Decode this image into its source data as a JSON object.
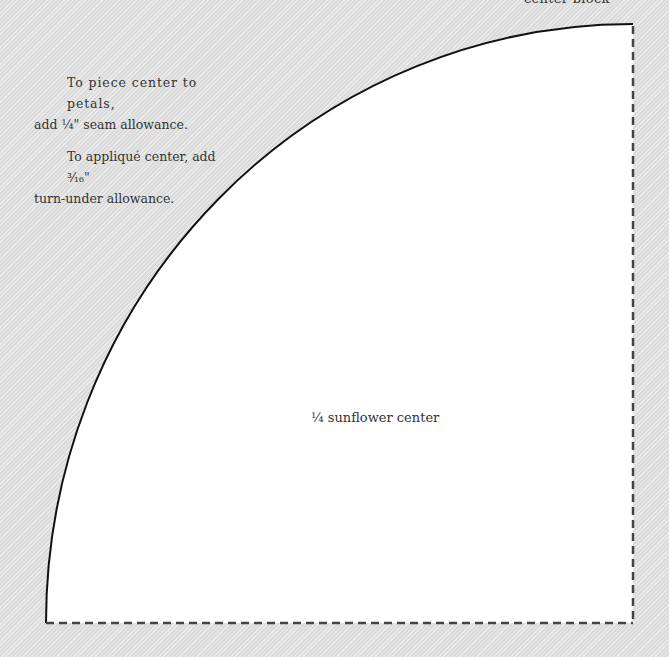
{
  "top_label": "center block",
  "notes": [
    {
      "line1": "To piece center to petals,",
      "line2": "add ¼\" seam allowance."
    },
    {
      "line1": "To appliqué center, add ³⁄₁₆\"",
      "line2": "turn-under allowance."
    }
  ],
  "piece_label": "¼ sunflower center",
  "colors": {
    "background": "#e2e2e2",
    "piece_fill": "#ffffff",
    "cut_line": "#111111",
    "fold_line": "#444444"
  }
}
